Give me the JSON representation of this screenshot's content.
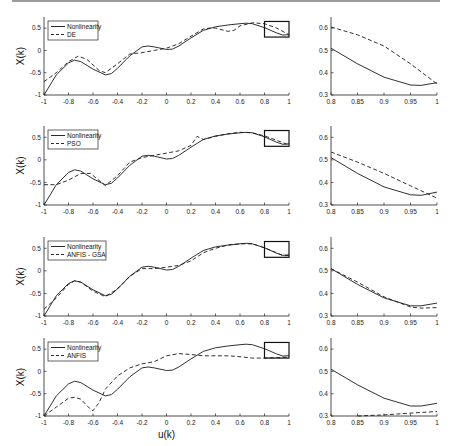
{
  "chart_data": [
    {
      "type": "line",
      "panel": "row1-left",
      "xlabel": "",
      "ylabel": "X(k)",
      "xlim": [
        -1,
        1
      ],
      "ylim": [
        -1,
        0.75
      ],
      "xticks": [
        "-1",
        "-0.8",
        "-0.6",
        "-0.4",
        "-0.2",
        "0",
        "0.2",
        "0.4",
        "0.6",
        "0.8",
        "1"
      ],
      "yticks": [
        "-1",
        "-0.5",
        "0",
        "0.5"
      ],
      "legend": [
        "Nonlinearity",
        "DE"
      ],
      "zoom_box": {
        "x": [
          0.8,
          1.0
        ],
        "y": [
          0.3,
          0.65
        ]
      },
      "series": [
        {
          "name": "Nonlinearity",
          "style": "solid",
          "x": [
            -1,
            -0.9,
            -0.8,
            -0.75,
            -0.7,
            -0.6,
            -0.5,
            -0.45,
            -0.4,
            -0.3,
            -0.2,
            -0.15,
            -0.1,
            0,
            0.05,
            0.1,
            0.2,
            0.3,
            0.4,
            0.5,
            0.6,
            0.65,
            0.7,
            0.8,
            0.9,
            0.95,
            1
          ],
          "y": [
            -1,
            -0.55,
            -0.28,
            -0.22,
            -0.25,
            -0.42,
            -0.55,
            -0.52,
            -0.4,
            -0.12,
            0.08,
            0.1,
            0.08,
            0.02,
            0.03,
            0.1,
            0.28,
            0.45,
            0.53,
            0.57,
            0.6,
            0.61,
            0.6,
            0.51,
            0.39,
            0.345,
            0.355
          ]
        },
        {
          "name": "DE",
          "style": "dashed",
          "x": [
            -1,
            -0.9,
            -0.8,
            -0.72,
            -0.65,
            -0.55,
            -0.5,
            -0.4,
            -0.3,
            -0.2,
            -0.1,
            0,
            0.1,
            0.2,
            0.3,
            0.35,
            0.4,
            0.5,
            0.55,
            0.6,
            0.7,
            0.8,
            0.9,
            1
          ],
          "y": [
            -0.7,
            -0.5,
            -0.25,
            -0.13,
            -0.2,
            -0.45,
            -0.5,
            -0.3,
            -0.08,
            -0.05,
            0.0,
            0.05,
            0.15,
            0.32,
            0.48,
            0.5,
            0.5,
            0.43,
            0.45,
            0.55,
            0.62,
            0.6,
            0.5,
            0.35
          ]
        }
      ]
    },
    {
      "type": "line",
      "panel": "row1-right",
      "xlim": [
        0.8,
        1.0
      ],
      "ylim": [
        0.3,
        0.65
      ],
      "xticks": [
        "0.8",
        "0.85",
        "0.9",
        "0.95",
        "1"
      ],
      "yticks": [
        "0.3",
        "0.4",
        "0.5",
        "0.6"
      ],
      "series": [
        {
          "name": "Nonlinearity",
          "style": "solid",
          "x": [
            0.8,
            0.85,
            0.9,
            0.95,
            0.97,
            1
          ],
          "y": [
            0.51,
            0.44,
            0.38,
            0.345,
            0.343,
            0.355
          ]
        },
        {
          "name": "DE",
          "style": "dashed",
          "x": [
            0.8,
            0.85,
            0.9,
            0.95,
            1
          ],
          "y": [
            0.605,
            0.57,
            0.52,
            0.44,
            0.35
          ]
        }
      ]
    },
    {
      "type": "line",
      "panel": "row2-left",
      "ylabel": "X(k)",
      "xlim": [
        -1,
        1
      ],
      "ylim": [
        -1,
        0.75
      ],
      "xticks": [
        "-1",
        "-0.8",
        "-0.6",
        "-0.4",
        "-0.2",
        "0",
        "0.2",
        "0.4",
        "0.6",
        "0.8",
        "1"
      ],
      "yticks": [
        "-1",
        "-0.5",
        "0",
        "0.5"
      ],
      "legend": [
        "Nonlinearity",
        "PSO"
      ],
      "zoom_box": {
        "x": [
          0.8,
          1.0
        ],
        "y": [
          0.3,
          0.65
        ]
      },
      "series": [
        {
          "name": "Nonlinearity",
          "style": "solid",
          "x": [
            -1,
            -0.9,
            -0.8,
            -0.75,
            -0.7,
            -0.6,
            -0.5,
            -0.45,
            -0.4,
            -0.3,
            -0.2,
            -0.15,
            -0.1,
            0,
            0.05,
            0.1,
            0.2,
            0.3,
            0.4,
            0.5,
            0.6,
            0.65,
            0.7,
            0.8,
            0.9,
            0.95,
            1
          ],
          "y": [
            -1,
            -0.55,
            -0.28,
            -0.22,
            -0.25,
            -0.42,
            -0.55,
            -0.52,
            -0.4,
            -0.12,
            0.08,
            0.1,
            0.08,
            0.02,
            0.03,
            0.1,
            0.28,
            0.45,
            0.53,
            0.57,
            0.6,
            0.61,
            0.6,
            0.51,
            0.39,
            0.345,
            0.355
          ]
        },
        {
          "name": "PSO",
          "style": "dashed",
          "x": [
            -1,
            -0.9,
            -0.8,
            -0.7,
            -0.62,
            -0.5,
            -0.4,
            -0.3,
            -0.2,
            -0.1,
            0,
            0.1,
            0.2,
            0.25,
            0.3,
            0.4,
            0.5,
            0.6,
            0.7,
            0.8,
            0.9,
            1
          ],
          "y": [
            -0.55,
            -0.55,
            -0.45,
            -0.3,
            -0.3,
            -0.57,
            -0.35,
            -0.05,
            0.05,
            0.1,
            0.15,
            0.2,
            0.32,
            0.52,
            0.45,
            0.52,
            0.58,
            0.61,
            0.6,
            0.53,
            0.43,
            0.33
          ]
        }
      ]
    },
    {
      "type": "line",
      "panel": "row2-right",
      "xlim": [
        0.8,
        1.0
      ],
      "ylim": [
        0.3,
        0.65
      ],
      "xticks": [
        "0.8",
        "0.85",
        "0.9",
        "0.95",
        "1"
      ],
      "yticks": [
        "0.3",
        "0.4",
        "0.5",
        "0.6"
      ],
      "series": [
        {
          "name": "Nonlinearity",
          "style": "solid",
          "x": [
            0.8,
            0.85,
            0.9,
            0.95,
            0.97,
            1
          ],
          "y": [
            0.51,
            0.44,
            0.38,
            0.345,
            0.343,
            0.357
          ]
        },
        {
          "name": "PSO",
          "style": "dashed",
          "x": [
            0.8,
            0.85,
            0.9,
            0.95,
            1
          ],
          "y": [
            0.535,
            0.49,
            0.44,
            0.385,
            0.33
          ]
        }
      ]
    },
    {
      "type": "line",
      "panel": "row3-left",
      "ylabel": "X(k)",
      "xlim": [
        -1,
        1
      ],
      "ylim": [
        -1,
        0.75
      ],
      "xticks": [
        "-1",
        "-0.8",
        "-0.6",
        "-0.4",
        "-0.2",
        "0",
        "0.2",
        "0.4",
        "0.6",
        "0.8",
        "1"
      ],
      "yticks": [
        "-1",
        "-0.5",
        "0",
        "0.5"
      ],
      "legend": [
        "Nonlinearity",
        "ANFIS - GSA"
      ],
      "zoom_box": {
        "x": [
          0.8,
          1.0
        ],
        "y": [
          0.3,
          0.65
        ]
      },
      "series": [
        {
          "name": "Nonlinearity",
          "style": "solid",
          "x": [
            -1,
            -0.9,
            -0.8,
            -0.75,
            -0.7,
            -0.6,
            -0.5,
            -0.45,
            -0.4,
            -0.3,
            -0.2,
            -0.15,
            -0.1,
            0,
            0.05,
            0.1,
            0.2,
            0.3,
            0.4,
            0.5,
            0.6,
            0.65,
            0.7,
            0.8,
            0.9,
            0.95,
            1
          ],
          "y": [
            -1,
            -0.55,
            -0.28,
            -0.22,
            -0.25,
            -0.42,
            -0.55,
            -0.52,
            -0.4,
            -0.12,
            0.08,
            0.1,
            0.08,
            0.02,
            0.03,
            0.1,
            0.28,
            0.45,
            0.53,
            0.57,
            0.6,
            0.61,
            0.6,
            0.51,
            0.39,
            0.345,
            0.355
          ]
        },
        {
          "name": "ANFIS - GSA",
          "style": "dashed",
          "x": [
            -1,
            -0.9,
            -0.8,
            -0.75,
            -0.7,
            -0.6,
            -0.5,
            -0.4,
            -0.3,
            -0.2,
            -0.1,
            0,
            0.1,
            0.2,
            0.3,
            0.4,
            0.5,
            0.6,
            0.7,
            0.8,
            0.9,
            0.95,
            1
          ],
          "y": [
            -0.85,
            -0.6,
            -0.3,
            -0.22,
            -0.25,
            -0.45,
            -0.57,
            -0.4,
            -0.12,
            0.05,
            0.05,
            0.08,
            0.12,
            0.22,
            0.4,
            0.5,
            0.57,
            0.6,
            0.6,
            0.51,
            0.4,
            0.335,
            0.34
          ]
        }
      ]
    },
    {
      "type": "line",
      "panel": "row3-right",
      "xlim": [
        0.8,
        1.0
      ],
      "ylim": [
        0.3,
        0.65
      ],
      "xticks": [
        "0.8",
        "0.85",
        "0.9",
        "0.95",
        "1"
      ],
      "yticks": [
        "0.3",
        "0.4",
        "0.5",
        "0.6"
      ],
      "series": [
        {
          "name": "Nonlinearity",
          "style": "solid",
          "x": [
            0.8,
            0.85,
            0.9,
            0.95,
            0.97,
            1
          ],
          "y": [
            0.51,
            0.44,
            0.38,
            0.345,
            0.345,
            0.357
          ]
        },
        {
          "name": "ANFIS - GSA",
          "style": "dashed",
          "x": [
            0.8,
            0.85,
            0.9,
            0.95,
            0.97,
            1
          ],
          "y": [
            0.51,
            0.45,
            0.385,
            0.34,
            0.335,
            0.337
          ]
        }
      ]
    },
    {
      "type": "line",
      "panel": "row4-left",
      "xlabel": "u(k)",
      "ylabel": "X(k)",
      "xlim": [
        -1,
        1
      ],
      "ylim": [
        -1,
        0.75
      ],
      "xticks": [
        "-1",
        "-0.8",
        "-0.6",
        "-0.4",
        "-0.2",
        "0",
        "0.2",
        "0.4",
        "0.6",
        "0.8",
        "1"
      ],
      "yticks": [
        "-1",
        "-0.5",
        "0",
        "0.5"
      ],
      "legend": [
        "Nonlinearity",
        "ANFIS"
      ],
      "zoom_box": {
        "x": [
          0.8,
          1.0
        ],
        "y": [
          0.3,
          0.65
        ]
      },
      "series": [
        {
          "name": "Nonlinearity",
          "style": "solid",
          "x": [
            -1,
            -0.9,
            -0.8,
            -0.75,
            -0.7,
            -0.6,
            -0.5,
            -0.45,
            -0.4,
            -0.3,
            -0.2,
            -0.15,
            -0.1,
            0,
            0.05,
            0.1,
            0.2,
            0.3,
            0.4,
            0.5,
            0.6,
            0.65,
            0.7,
            0.8,
            0.9,
            0.95,
            1
          ],
          "y": [
            -1,
            -0.55,
            -0.28,
            -0.22,
            -0.25,
            -0.42,
            -0.55,
            -0.52,
            -0.4,
            -0.12,
            0.08,
            0.1,
            0.08,
            0.02,
            0.03,
            0.1,
            0.28,
            0.45,
            0.53,
            0.57,
            0.6,
            0.61,
            0.6,
            0.51,
            0.39,
            0.345,
            0.355
          ]
        },
        {
          "name": "ANFIS",
          "style": "dashed",
          "x": [
            -1,
            -0.9,
            -0.8,
            -0.75,
            -0.7,
            -0.62,
            -0.6,
            -0.55,
            -0.5,
            -0.4,
            -0.3,
            -0.2,
            -0.1,
            0,
            0.1,
            0.2,
            0.3,
            0.4,
            0.5,
            0.6,
            0.7,
            0.8,
            0.9,
            1
          ],
          "y": [
            -1,
            -0.8,
            -0.6,
            -0.58,
            -0.62,
            -0.85,
            -0.88,
            -0.7,
            -0.4,
            -0.1,
            0.08,
            0.17,
            0.22,
            0.35,
            0.4,
            0.38,
            0.35,
            0.35,
            0.35,
            0.33,
            0.3,
            0.3,
            0.31,
            0.32
          ]
        }
      ]
    },
    {
      "type": "line",
      "panel": "row4-right",
      "xlim": [
        0.8,
        1.0
      ],
      "ylim": [
        0.3,
        0.65
      ],
      "xticks": [
        "0.8",
        "0.85",
        "0.9",
        "0.95",
        "1"
      ],
      "yticks": [
        "0.3",
        "0.4",
        "0.5",
        "0.6"
      ],
      "series": [
        {
          "name": "Nonlinearity",
          "style": "solid",
          "x": [
            0.8,
            0.85,
            0.9,
            0.95,
            0.97,
            1
          ],
          "y": [
            0.51,
            0.44,
            0.38,
            0.345,
            0.345,
            0.357
          ]
        },
        {
          "name": "ANFIS",
          "style": "dashed",
          "x": [
            0.85,
            0.9,
            0.95,
            1
          ],
          "y": [
            0.3,
            0.305,
            0.313,
            0.32
          ]
        }
      ]
    }
  ]
}
